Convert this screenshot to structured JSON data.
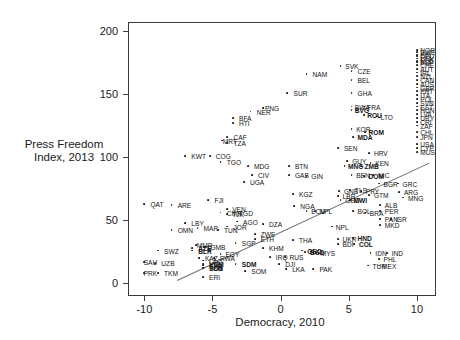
{
  "chart_data": {
    "type": "scatter",
    "title": "",
    "xlabel": "Democracy, 2010",
    "ylabel": "Press Freedom Index, 2013",
    "ylabel_line1": "Press Freedom",
    "ylabel_line2": "Index, 2013",
    "xlim": [
      -11.2,
      11.4
    ],
    "ylim": [
      -10,
      207
    ],
    "xticks": [
      -10,
      -5,
      0,
      5,
      10
    ],
    "yticks": [
      0,
      50,
      100,
      150,
      200
    ],
    "xtick_labels": [
      "-10",
      "-5",
      "0",
      "5",
      "10"
    ],
    "ytick_labels": [
      "0",
      "50",
      "100",
      "150",
      "200"
    ],
    "grid": false,
    "legend": "none",
    "point_color": "#1c1c1c",
    "line_color": "#6e6e6e",
    "frame_color": "#3a3a3a",
    "trendline": {
      "x1": -7.6,
      "y1": 3,
      "x2": 10.9,
      "y2": 96
    },
    "points": [
      {
        "label": "PRK",
        "x": -10.0,
        "y": 8,
        "lx": -0.2,
        "ly": 0
      },
      {
        "label": "TKM",
        "x": -9.0,
        "y": 8,
        "lx": 0.3,
        "ly": 0
      },
      {
        "label": "SAU",
        "x": -10.0,
        "y": 17,
        "lx": -0.2,
        "ly": 0
      },
      {
        "label": "UZB",
        "x": -9.2,
        "y": 16,
        "lx": 0.3,
        "ly": 0
      },
      {
        "label": "SWZ",
        "x": -9.0,
        "y": 26,
        "lx": 0.3,
        "ly": 0
      },
      {
        "label": "QAT",
        "x": -10.0,
        "y": 63,
        "lx": 0.3,
        "ly": 0
      },
      {
        "label": "OMN",
        "x": -8.0,
        "y": 42,
        "lx": 0.3,
        "ly": 0
      },
      {
        "label": "LBY",
        "x": -7.0,
        "y": 48,
        "lx": 0.3,
        "ly": 0
      },
      {
        "label": "ARE",
        "x": -8.0,
        "y": 62,
        "lx": 0.3,
        "ly": 0
      },
      {
        "label": "MAR",
        "x": -6.1,
        "y": 44,
        "lx": 0.3,
        "ly": 0
      },
      {
        "label": "AZE",
        "x": -6.5,
        "y": 28,
        "lx": 0.3,
        "ly": 0,
        "bold": true
      },
      {
        "label": "BLR",
        "x": -6.5,
        "y": 26,
        "lx": 0.3,
        "ly": 0,
        "bold": true
      },
      {
        "label": "MMR",
        "x": -6.2,
        "y": 30,
        "lx": -0.1,
        "ly": 0
      },
      {
        "label": "GMB",
        "x": -5.6,
        "y": 29,
        "lx": 0.3,
        "ly": 0
      },
      {
        "label": "KAZ",
        "x": -6.0,
        "y": 20,
        "lx": 0.3,
        "ly": 0
      },
      {
        "label": "RWA",
        "x": -4.9,
        "y": 20,
        "lx": 0.3,
        "ly": 0
      },
      {
        "label": "EGY",
        "x": -4.4,
        "y": 23,
        "lx": 0.2,
        "ly": 0
      },
      {
        "label": "LAO",
        "x": -5.7,
        "y": 18,
        "lx": 0.3,
        "ly": 0
      },
      {
        "label": "ERI",
        "x": -5.7,
        "y": 5,
        "lx": 0.3,
        "ly": 0
      },
      {
        "label": "TCD",
        "x": -5.7,
        "y": 12,
        "lx": 0.3,
        "ly": 0,
        "bold": true
      },
      {
        "label": "SDN",
        "x": -5.7,
        "y": 12,
        "lx": 0.3,
        "ly": 0,
        "bold": true
      },
      {
        "label": "SYR",
        "x": -5.7,
        "y": 14,
        "lx": 0.3,
        "ly": 0,
        "bold": true
      },
      {
        "label": "VNM",
        "x": -5.7,
        "y": 15,
        "lx": 0.3,
        "ly": 0,
        "bold": true
      },
      {
        "label": "KWT",
        "x": -7.0,
        "y": 101,
        "lx": 0.3,
        "ly": 0
      },
      {
        "label": "COG",
        "x": -5.2,
        "y": 101,
        "lx": 0.3,
        "ly": 0
      },
      {
        "label": "TGO",
        "x": -4.4,
        "y": 96,
        "lx": 0.3,
        "ly": 0
      },
      {
        "label": "MRT",
        "x": -4.3,
        "y": 113,
        "lx": -0.1,
        "ly": 0
      },
      {
        "label": "CAF",
        "x": -3.9,
        "y": 116,
        "lx": 0.3,
        "ly": 0
      },
      {
        "label": "TZA",
        "x": -3.9,
        "y": 111,
        "lx": 0.3,
        "ly": 0
      },
      {
        "label": "BFA",
        "x": -3.5,
        "y": 131,
        "lx": 0.3,
        "ly": 0
      },
      {
        "label": "HTI",
        "x": -3.5,
        "y": 127,
        "lx": 0.3,
        "ly": 0
      },
      {
        "label": "FJI",
        "x": -5.3,
        "y": 66,
        "lx": 0.3,
        "ly": 0
      },
      {
        "label": "CMR",
        "x": -4.4,
        "y": 56,
        "lx": 0.3,
        "ly": 0
      },
      {
        "label": "VEN",
        "x": -3.9,
        "y": 59,
        "lx": 0.2,
        "ly": 0
      },
      {
        "label": "TJK",
        "x": -3.9,
        "y": 55,
        "lx": 0.2,
        "ly": 0
      },
      {
        "label": "TGD",
        "x": -3.4,
        "y": 56,
        "lx": 0.2,
        "ly": 0
      },
      {
        "label": "AGO",
        "x": -3.2,
        "y": 49,
        "lx": 0.3,
        "ly": 0
      },
      {
        "label": "JOR",
        "x": -3.9,
        "y": 45,
        "lx": 0.3,
        "ly": 0
      },
      {
        "label": "TUN",
        "x": -4.6,
        "y": 42,
        "lx": 0.3,
        "ly": 0
      },
      {
        "label": "SGP",
        "x": -3.3,
        "y": 32,
        "lx": 0.3,
        "ly": 0
      },
      {
        "label": "SDM",
        "x": -3.3,
        "y": 15,
        "lx": 0.3,
        "ly": 0,
        "bold": true
      },
      {
        "label": "SOM",
        "x": -2.6,
        "y": 10,
        "lx": 0.3,
        "ly": 0
      },
      {
        "label": "MDG",
        "x": -2.4,
        "y": 93,
        "lx": 0.3,
        "ly": 0
      },
      {
        "label": "CIV",
        "x": -2.1,
        "y": 86,
        "lx": 0.3,
        "ly": 0
      },
      {
        "label": "UGA",
        "x": -2.7,
        "y": 80,
        "lx": 0.3,
        "ly": 0
      },
      {
        "label": "DZA",
        "x": -1.3,
        "y": 47,
        "lx": 0.3,
        "ly": 0
      },
      {
        "label": "ZWE",
        "x": -1.9,
        "y": 39,
        "lx": 0.3,
        "ly": 0
      },
      {
        "label": "ETH",
        "x": -1.9,
        "y": 35,
        "lx": 0.3,
        "ly": 0
      },
      {
        "label": "KHM",
        "x": -1.3,
        "y": 28,
        "lx": 0.3,
        "ly": 0
      },
      {
        "label": "IRQ",
        "x": -0.8,
        "y": 21,
        "lx": 0.3,
        "ly": 0
      },
      {
        "label": "DJI",
        "x": -0.1,
        "y": 15,
        "lx": 0.3,
        "ly": 0
      },
      {
        "label": "NER",
        "x": -2.2,
        "y": 136,
        "lx": 0.3,
        "ly": 0
      },
      {
        "label": "PNG",
        "x": -1.3,
        "y": 139,
        "lx": 0.0,
        "ly": 0
      },
      {
        "label": "SUR",
        "x": 0.5,
        "y": 151,
        "lx": 0.3,
        "ly": 0
      },
      {
        "label": "NAM",
        "x": 1.9,
        "y": 166,
        "lx": 0.3,
        "ly": 0
      },
      {
        "label": "BTN",
        "x": 0.6,
        "y": 93,
        "lx": 0.3,
        "ly": 0
      },
      {
        "label": "GAB",
        "x": 0.6,
        "y": 86,
        "lx": 0.3,
        "ly": 0
      },
      {
        "label": "GIN",
        "x": 1.9,
        "y": 85,
        "lx": 0.2,
        "ly": 0
      },
      {
        "label": "KGZ",
        "x": 0.9,
        "y": 71,
        "lx": 0.3,
        "ly": 0
      },
      {
        "label": "NGA",
        "x": 1.0,
        "y": 61,
        "lx": 0.3,
        "ly": 0
      },
      {
        "label": "ECU",
        "x": 1.9,
        "y": 57,
        "lx": 0.2,
        "ly": 0
      },
      {
        "label": "NPL",
        "x": 2.5,
        "y": 57,
        "lx": 0.2,
        "ly": 0
      },
      {
        "label": "THA",
        "x": 0.9,
        "y": 34,
        "lx": 0.3,
        "ly": 0
      },
      {
        "label": "RUS",
        "x": 0.3,
        "y": 21,
        "lx": 0.2,
        "ly": 0
      },
      {
        "label": "GEO",
        "x": 1.6,
        "y": 26,
        "lx": 0.2,
        "ly": 0,
        "bold": true
      },
      {
        "label": "BGD",
        "x": 1.8,
        "y": 25,
        "lx": 0.2,
        "ly": 0,
        "bold": true
      },
      {
        "label": "MYS",
        "x": 2.6,
        "y": 24,
        "lx": 0.2,
        "ly": 0
      },
      {
        "label": "LKA",
        "x": 0.4,
        "y": 11,
        "lx": 0.3,
        "ly": 0
      },
      {
        "label": "PAK",
        "x": 2.4,
        "y": 11,
        "lx": 0.3,
        "ly": 0
      },
      {
        "label": "CZE",
        "x": 5.2,
        "y": 168,
        "lx": 0.3,
        "ly": 0
      },
      {
        "label": "BEL",
        "x": 5.2,
        "y": 161,
        "lx": 0.3,
        "ly": 0
      },
      {
        "label": "GHA",
        "x": 5.2,
        "y": 151,
        "lx": 0.3,
        "ly": 0
      },
      {
        "label": "SVK",
        "x": 4.4,
        "y": 172,
        "lx": 0.2,
        "ly": 0
      },
      {
        "label": "BWA",
        "x": 5.2,
        "y": 140,
        "lx": 0.1,
        "ly": 0
      },
      {
        "label": "BVG",
        "x": 5.2,
        "y": 137,
        "lx": 0.1,
        "ly": 0,
        "bold": true
      },
      {
        "label": "FRA",
        "x": 6.1,
        "y": 140,
        "lx": 0.1,
        "ly": 0
      },
      {
        "label": "ROU",
        "x": 6.1,
        "y": 133,
        "lx": 0.1,
        "ly": 0,
        "bold": true
      },
      {
        "label": "LTO",
        "x": 7.1,
        "y": 132,
        "lx": 0.1,
        "ly": 0
      },
      {
        "label": "KOR",
        "x": 5.2,
        "y": 122,
        "lx": 0.2,
        "ly": 0
      },
      {
        "label": "MDA",
        "x": 5.3,
        "y": 116,
        "lx": 0.2,
        "ly": 0,
        "bold": true
      },
      {
        "label": "ROM",
        "x": 6.2,
        "y": 120,
        "lx": 0.1,
        "ly": 0,
        "bold": true
      },
      {
        "label": "SEN",
        "x": 4.2,
        "y": 107,
        "lx": 0.3,
        "ly": 0
      },
      {
        "label": "HRV",
        "x": 6.5,
        "y": 103,
        "lx": 0.2,
        "ly": 0
      },
      {
        "label": "GUY",
        "x": 4.9,
        "y": 97,
        "lx": 0.2,
        "ly": 0
      },
      {
        "label": "MNG",
        "x": 4.7,
        "y": 93,
        "lx": 0.1,
        "ly": 0,
        "bold": true
      },
      {
        "label": "ZMB",
        "x": 5.9,
        "y": 93,
        "lx": 0.1,
        "ly": 0,
        "bold": true
      },
      {
        "label": "KEN",
        "x": 6.6,
        "y": 95,
        "lx": 0.2,
        "ly": 0
      },
      {
        "label": "BEN",
        "x": 5.2,
        "y": 86,
        "lx": 0.2,
        "ly": 0
      },
      {
        "label": "DOM",
        "x": 6.1,
        "y": 85,
        "lx": 0.2,
        "ly": 0,
        "bold": true
      },
      {
        "label": "NIC",
        "x": 6.8,
        "y": 86,
        "lx": 0.2,
        "ly": 0
      },
      {
        "label": "BGR",
        "x": 7.2,
        "y": 79,
        "lx": 0.2,
        "ly": 0
      },
      {
        "label": "GRC",
        "x": 8.6,
        "y": 79,
        "lx": 0.2,
        "ly": 0
      },
      {
        "label": "GNB",
        "x": 4.3,
        "y": 73,
        "lx": 0.2,
        "ly": 0
      },
      {
        "label": "TLS",
        "x": 5.1,
        "y": 74,
        "lx": 0.2,
        "ly": 0
      },
      {
        "label": "PRY",
        "x": 5.9,
        "y": 73,
        "lx": 0.2,
        "ly": 0
      },
      {
        "label": "GTM",
        "x": 6.5,
        "y": 70,
        "lx": 0.2,
        "ly": 0
      },
      {
        "label": "LBR",
        "x": 4.2,
        "y": 69,
        "lx": 0.2,
        "ly": 0
      },
      {
        "label": "GEO",
        "x": 4.4,
        "y": 66,
        "lx": 0.2,
        "ly": 0
      },
      {
        "label": "MWI",
        "x": 5.1,
        "y": 66,
        "lx": 0.1,
        "ly": 0,
        "bold": true
      },
      {
        "label": "MNG",
        "x": 9.0,
        "y": 68,
        "lx": 0.2,
        "ly": 0
      },
      {
        "label": "ALB",
        "x": 7.3,
        "y": 62,
        "lx": 0.2,
        "ly": 0
      },
      {
        "label": "PER",
        "x": 7.3,
        "y": 57,
        "lx": 0.2,
        "ly": 0
      },
      {
        "label": "BOL",
        "x": 5.3,
        "y": 57,
        "lx": 0.2,
        "ly": 0
      },
      {
        "label": "BRA",
        "x": 6.2,
        "y": 56,
        "lx": 0.2,
        "ly": 0
      },
      {
        "label": "PAN",
        "x": 7.3,
        "y": 51,
        "lx": 0.2,
        "ly": 0
      },
      {
        "label": "ISR",
        "x": 8.1,
        "y": 51,
        "lx": 0.2,
        "ly": 0
      },
      {
        "label": "MKD",
        "x": 7.3,
        "y": 46,
        "lx": 0.2,
        "ly": 0
      },
      {
        "label": "NPL",
        "x": 3.8,
        "y": 45,
        "lx": 0.1,
        "ly": 0
      },
      {
        "label": "UKR",
        "x": 4.2,
        "y": 35,
        "lx": 0.2,
        "ly": 0
      },
      {
        "label": "HND",
        "x": 5.3,
        "y": 36,
        "lx": 0.2,
        "ly": 0,
        "bold": true
      },
      {
        "label": "BDI",
        "x": 4.2,
        "y": 31,
        "lx": 0.2,
        "ly": 0
      },
      {
        "label": "COL",
        "x": 5.4,
        "y": 31,
        "lx": 0.2,
        "ly": 0,
        "bold": true
      },
      {
        "label": "IDN",
        "x": 6.6,
        "y": 24,
        "lx": 0.2,
        "ly": 0
      },
      {
        "label": "IND",
        "x": 7.8,
        "y": 24,
        "lx": 0.2,
        "ly": 0
      },
      {
        "label": "PHL",
        "x": 7.2,
        "y": 19,
        "lx": 0.2,
        "ly": 0
      },
      {
        "label": "TUR",
        "x": 6.4,
        "y": 14,
        "lx": 0.2,
        "ly": 0
      },
      {
        "label": "MEX",
        "x": 7.2,
        "y": 14,
        "lx": 0.1,
        "ly": 0
      },
      {
        "label": "ARG",
        "x": 8.7,
        "y": 72,
        "lx": 0.2,
        "ly": 0
      },
      {
        "label": "CHL",
        "x": 10.0,
        "y": 120,
        "lx": 0.1,
        "ly": 0
      },
      {
        "label": "JPN",
        "x": 10.0,
        "y": 116,
        "lx": 0.1,
        "ly": 0
      },
      {
        "label": "USA",
        "x": 10.0,
        "y": 110,
        "lx": 0.1,
        "ly": 0
      },
      {
        "label": "ESP",
        "x": 10.0,
        "y": 175,
        "lx": 0.1,
        "ly": 0
      },
      {
        "label": "DEU",
        "x": 10.0,
        "y": 180,
        "lx": 0.1,
        "ly": 0
      },
      {
        "label": "NOR",
        "x": 10.0,
        "y": 185,
        "lx": 0.1,
        "ly": 0
      },
      {
        "label": "SWE",
        "x": 10.0,
        "y": 183,
        "lx": 0.1,
        "ly": 0
      },
      {
        "label": "FIN",
        "x": 10.0,
        "y": 181,
        "lx": 0.1,
        "ly": 0
      },
      {
        "label": "DNK",
        "x": 10.0,
        "y": 178,
        "lx": 0.1,
        "ly": 0
      },
      {
        "label": "NLD",
        "x": 10.0,
        "y": 176,
        "lx": 0.1,
        "ly": 0
      },
      {
        "label": "CHE",
        "x": 10.0,
        "y": 173,
        "lx": 0.1,
        "ly": 0
      },
      {
        "label": "AUT",
        "x": 10.0,
        "y": 170,
        "lx": 0.1,
        "ly": 0
      },
      {
        "label": "IRL",
        "x": 10.0,
        "y": 167,
        "lx": 0.1,
        "ly": 0
      },
      {
        "label": "NZL",
        "x": 10.0,
        "y": 164,
        "lx": 0.1,
        "ly": 0
      },
      {
        "label": "CAN",
        "x": 10.0,
        "y": 161,
        "lx": 0.1,
        "ly": 0
      },
      {
        "label": "AUS",
        "x": 10.0,
        "y": 158,
        "lx": 0.1,
        "ly": 0
      },
      {
        "label": "GBR",
        "x": 10.0,
        "y": 155,
        "lx": 0.1,
        "ly": 0
      },
      {
        "label": "PRT",
        "x": 10.0,
        "y": 152,
        "lx": 0.1,
        "ly": 0
      },
      {
        "label": "ITA",
        "x": 10.0,
        "y": 149,
        "lx": 0.1,
        "ly": 0
      },
      {
        "label": "POL",
        "x": 10.0,
        "y": 146,
        "lx": 0.1,
        "ly": 0
      },
      {
        "label": "SVN",
        "x": 10.0,
        "y": 143,
        "lx": 0.1,
        "ly": 0
      },
      {
        "label": "EST",
        "x": 10.0,
        "y": 140,
        "lx": 0.1,
        "ly": 0
      },
      {
        "label": "HUN",
        "x": 10.0,
        "y": 137,
        "lx": 0.1,
        "ly": 0
      },
      {
        "label": "LVA",
        "x": 10.0,
        "y": 134,
        "lx": 0.1,
        "ly": 0
      },
      {
        "label": "URY",
        "x": 10.0,
        "y": 131,
        "lx": 0.1,
        "ly": 0
      },
      {
        "label": "CRI",
        "x": 10.0,
        "y": 128,
        "lx": 0.1,
        "ly": 0
      },
      {
        "label": "ZAF",
        "x": 10.0,
        "y": 125,
        "lx": 0.1,
        "ly": 0
      },
      {
        "label": "MUS",
        "x": 10.0,
        "y": 104,
        "lx": 0.1,
        "ly": 0
      },
      {
        "label": "CYP",
        "x": 10.0,
        "y": 107,
        "lx": 0.1,
        "ly": 0
      }
    ]
  }
}
